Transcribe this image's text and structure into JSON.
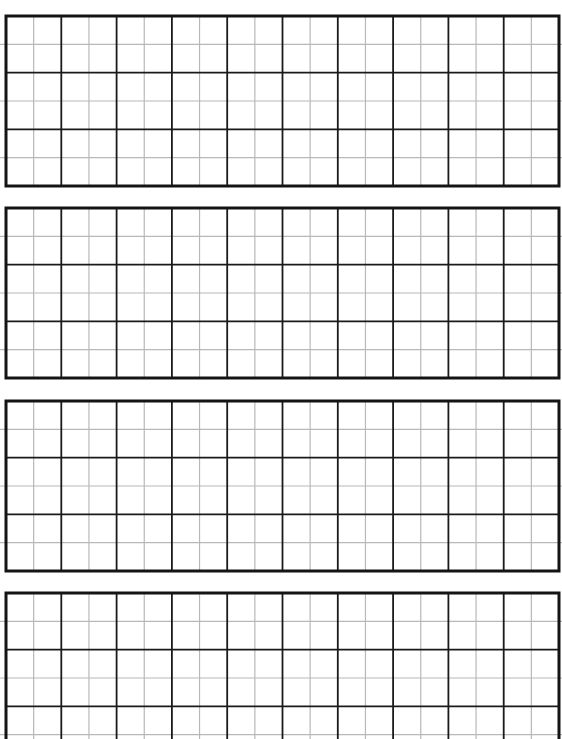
{
  "page": {
    "background_color": "#ffffff",
    "major_line_color": "#1a1a1a",
    "minor_line_color": "#b8b8b8",
    "border_color": "#141414"
  },
  "grid_blocks": [
    {
      "name": "grid-block-1",
      "major_columns": 10,
      "major_rows": 3,
      "subdivisions": 2,
      "cut_off": false
    },
    {
      "name": "grid-block-2",
      "major_columns": 10,
      "major_rows": 3,
      "subdivisions": 2,
      "cut_off": false
    },
    {
      "name": "grid-block-3",
      "major_columns": 10,
      "major_rows": 3,
      "subdivisions": 2,
      "cut_off": false
    },
    {
      "name": "grid-block-4",
      "major_columns": 10,
      "major_rows": 3,
      "subdivisions": 2,
      "cut_off": true
    }
  ]
}
